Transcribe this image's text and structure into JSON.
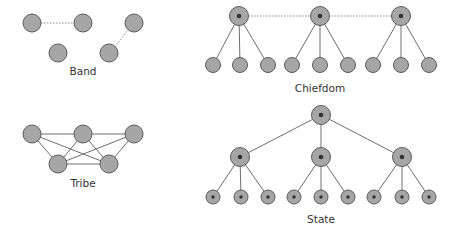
{
  "diagrams": {
    "band": {
      "label": "Band"
    },
    "tribe": {
      "label": "Tribe"
    },
    "chiefdom": {
      "label": "Chiefdom"
    },
    "state": {
      "label": "State"
    }
  },
  "colors": {
    "node_fill": "#a6a6a6",
    "node_stroke": "#5c5c5c",
    "center_dot": "#333333",
    "edge": "#6e6e6e"
  }
}
